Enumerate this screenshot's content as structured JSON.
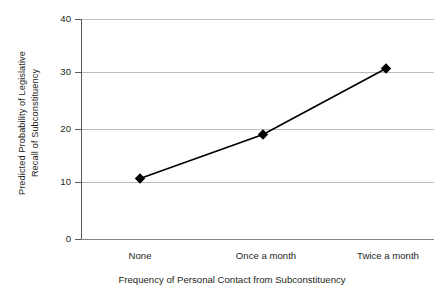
{
  "chart_data": {
    "type": "line",
    "title": "",
    "categories": [
      "None",
      "Once a month",
      "Twice a month"
    ],
    "values": [
      11,
      19,
      31
    ],
    "xlabel": "Frequency of Personal Contact from Subconstituency",
    "ylabel_line1": "Predicted Probability of Legislative",
    "ylabel_line2": "Recall of Subconstituency",
    "ylabel": "Predicted Probability of Legislative Recall of Subconstituency",
    "ylim": [
      0,
      40
    ],
    "yticks": [
      0,
      10,
      20,
      30,
      40
    ],
    "ytick_labels": [
      "0",
      "10",
      "20",
      "30",
      "40"
    ],
    "grid": "horizontal",
    "legend": "none",
    "series": [
      {
        "name": "Predicted Probability",
        "values": [
          11,
          19,
          31
        ],
        "marker": "diamond",
        "color": "#000000"
      }
    ],
    "colors": {
      "line": "#000000",
      "marker": "#000000",
      "grid": "#bcbcbc",
      "axis": "#58595b",
      "text": "#231f20",
      "background": "#ffffff"
    }
  }
}
